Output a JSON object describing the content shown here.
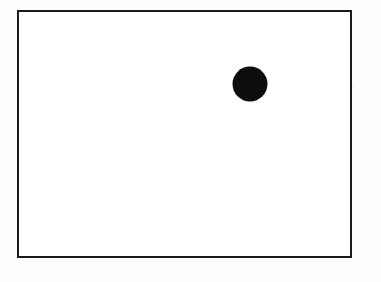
{
  "figure": {
    "kind": "line-art-diagram",
    "page_background_color": "#ffffff",
    "canvas": {
      "width": 381,
      "height": 282
    },
    "frame": {
      "label": "rectangular border",
      "shape": "rectangle",
      "x": 18,
      "y": 11,
      "width": 333,
      "height": 246,
      "stroke_color": "#1a1a1a",
      "stroke_width": 2,
      "fill_color": "#ffffff"
    },
    "marks": [
      {
        "label": "filled dot",
        "shape": "circle",
        "center_x": 250,
        "center_y": 84,
        "radius": 17.5,
        "diameter": 35,
        "fill_color": "#0d0d0d",
        "stroke_color": "none"
      }
    ]
  }
}
